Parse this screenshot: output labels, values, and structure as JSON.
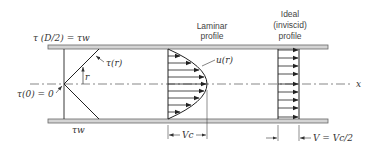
{
  "figure": {
    "labels": {
      "tau_wall_top": "τ (D/2) = τw",
      "tau_r": "τ(r)",
      "r": "r",
      "tau_center": "τ(0) = 0",
      "tau_wall_bottom": "τw",
      "u_r": "u(r)",
      "x_axis": "x",
      "laminar_title_1": "Laminar",
      "laminar_title_2": "profile",
      "ideal_title_1": "Ideal",
      "ideal_title_2": "(inviscid)",
      "ideal_title_3": "profile",
      "vc": "Vc",
      "v_avg": "V = Vc/2"
    },
    "colors": {
      "wall_fill": "#d4d4d4",
      "wall_stroke": "#555555",
      "line": "#222222",
      "text": "#333333"
    }
  }
}
